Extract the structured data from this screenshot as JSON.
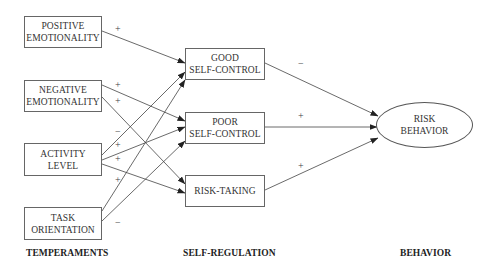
{
  "diagram": {
    "temperaments": [
      {
        "id": "positive",
        "line1": "POSITIVE",
        "line2": "EMOTIONALITY"
      },
      {
        "id": "negative",
        "line1": "NEGATIVE",
        "line2": "EMOTIONALITY"
      },
      {
        "id": "activity",
        "line1": "ACTIVITY",
        "line2": "LEVEL"
      },
      {
        "id": "task",
        "line1": "TASK",
        "line2": "ORIENTATION"
      }
    ],
    "self_regulation": [
      {
        "id": "good",
        "line1": "GOOD",
        "line2": "SELF-CONTROL"
      },
      {
        "id": "poor",
        "line1": "POOR",
        "line2": "SELF-CONTROL"
      },
      {
        "id": "risk_taking",
        "line1": "RISK-TAKING",
        "line2": ""
      }
    ],
    "behavior": {
      "id": "risk_behavior",
      "line1": "RISK",
      "line2": "BEHAVIOR"
    },
    "edges": [
      {
        "from": "positive",
        "to": "good",
        "sign": "+"
      },
      {
        "from": "negative",
        "to": "poor",
        "sign": "+"
      },
      {
        "from": "negative",
        "to": "risk_taking",
        "sign": "+"
      },
      {
        "from": "activity",
        "to": "good",
        "sign": "−"
      },
      {
        "from": "activity",
        "to": "poor",
        "sign": "+"
      },
      {
        "from": "activity",
        "to": "risk_taking",
        "sign": "+"
      },
      {
        "from": "task",
        "to": "good",
        "sign": "+"
      },
      {
        "from": "task",
        "to": "poor",
        "sign": "−"
      },
      {
        "from": "good",
        "to": "risk_behavior",
        "sign": "−"
      },
      {
        "from": "poor",
        "to": "risk_behavior",
        "sign": "+"
      },
      {
        "from": "risk_taking",
        "to": "risk_behavior",
        "sign": "+"
      }
    ],
    "signs": [
      "+",
      "+",
      "+",
      "−",
      "+",
      "+",
      "+",
      "−",
      "−",
      "+",
      "+"
    ],
    "column_labels": {
      "temperaments": "TEMPERAMENTS",
      "self_regulation": "SELF-REGULATION",
      "behavior": "BEHAVIOR"
    }
  }
}
